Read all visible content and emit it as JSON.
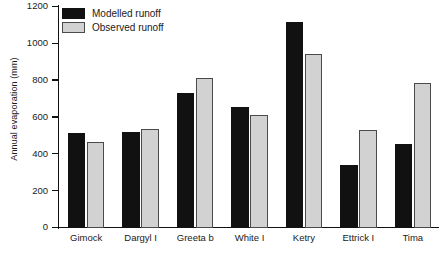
{
  "chart_data": {
    "type": "bar",
    "title": "",
    "xlabel": "",
    "ylabel": "Annual evaporation (mm)",
    "ylim": [
      0,
      1200
    ],
    "ytick_values": [
      0,
      200,
      400,
      600,
      800,
      1000,
      1200
    ],
    "ytick_labels": [
      "0",
      "200",
      "400",
      "600",
      "800",
      "1000",
      "1200"
    ],
    "grid": false,
    "legend_position": "top-left",
    "categories": [
      "Gimock",
      "Dargyl I",
      "Greeta b",
      "White I",
      "Ketry",
      "Ettrick I",
      "Tima"
    ],
    "series": [
      {
        "name": "Modelled runoff",
        "color": "#111111",
        "values": [
          516,
          522,
          735,
          657,
          1120,
          342,
          456
        ]
      },
      {
        "name": "Observed runoff",
        "color": "#d2d2d2",
        "values": [
          467,
          538,
          816,
          614,
          945,
          533,
          788
        ]
      }
    ]
  }
}
